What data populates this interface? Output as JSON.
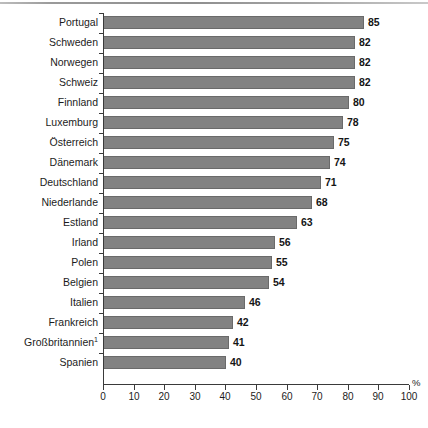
{
  "chart_data": {
    "type": "bar",
    "orientation": "horizontal",
    "title": "",
    "subtitle": "",
    "xlabel": "%",
    "ylabel": "",
    "xlim": [
      0,
      100
    ],
    "xticks": [
      0,
      10,
      20,
      30,
      40,
      50,
      60,
      70,
      80,
      90,
      100
    ],
    "grid": false,
    "legend": null,
    "bar_color": "#828282",
    "bar_edge_color": "#6a6a6a",
    "text_color": "#1c1c1c",
    "value_labels_shown": true,
    "categories": [
      "Portugal",
      "Schweden",
      "Norwegen",
      "Schweiz",
      "Finnland",
      "Luxemburg",
      "Österreich",
      "Dänemark",
      "Deutschland",
      "Niederlande",
      "Estland",
      "Irland",
      "Polen",
      "Belgien",
      "Italien",
      "Frankreich",
      "Großbritannien",
      "Spanien"
    ],
    "category_footnotes": [
      "",
      "",
      "",
      "",
      "",
      "",
      "",
      "",
      "",
      "",
      "",
      "",
      "",
      "",
      "",
      "",
      "1",
      ""
    ],
    "values": [
      85,
      82,
      82,
      82,
      80,
      78,
      75,
      74,
      71,
      68,
      63,
      56,
      55,
      54,
      46,
      42,
      41,
      40
    ]
  }
}
